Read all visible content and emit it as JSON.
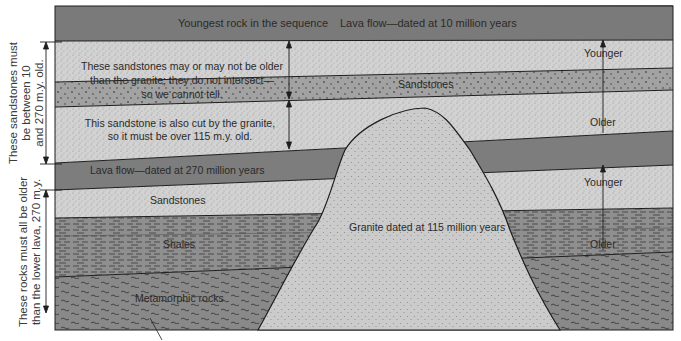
{
  "diagram": {
    "type": "geologic-cross-section",
    "colors": {
      "lava": "#7d7d7d",
      "sandstone_light": "#cfcfcf",
      "sandstone_coarse": "#9c9c9c",
      "shale": "#8e8e8e",
      "metamorphic": "#8a8a8a",
      "granite": "#c9c9c9",
      "line": "#1e1e1e"
    },
    "layers": [
      {
        "id": "upper-lava",
        "label": "Lava flow—dated at 10 million years",
        "note": "Youngest rock in the sequence"
      },
      {
        "id": "upper-sandstone-1",
        "label": "These sandstones may or may not be older than the granite; they do not intersect—so we cannot tell."
      },
      {
        "id": "upper-sandstone-coarse",
        "label": "Sandstones"
      },
      {
        "id": "upper-sandstone-2",
        "label": "This sandstone is also cut by the granite, so it must be over 115 m.y. old."
      },
      {
        "id": "lower-lava",
        "label": "Lava flow—dated at 270 million years"
      },
      {
        "id": "lower-sandstone",
        "label": "Sandstones"
      },
      {
        "id": "shales",
        "label": "Shales"
      },
      {
        "id": "metamorphic",
        "label": "Metamorphic rocks"
      },
      {
        "id": "granite",
        "label": "Granite dated at 115 million years"
      }
    ],
    "text": {
      "youngest": "Youngest rock in the sequence",
      "lava_top": "Lava flow—dated at 10 million years",
      "may_or_may_not_1": "These sandstones may or may not be older",
      "may_or_may_not_2": "than the granite; they do not intersect—",
      "may_or_may_not_3": "so we cannot tell.",
      "sandstones_upper": "Sandstones",
      "cut_by_granite_1": "This sandstone is also cut by the granite,",
      "cut_by_granite_2": "so it must be over 115 m.y. old.",
      "lava_mid": "Lava flow—dated at 270 million years",
      "sandstones_lower": "Sandstones",
      "shales": "Shales",
      "metamorphic": "Metamorphic rocks",
      "granite": "Granite dated at 115 million years",
      "younger_upper": "Younger",
      "older_upper": "Older",
      "younger_lower": "Younger",
      "older_lower": "Older"
    },
    "side_labels": {
      "upper": [
        "These sandstones must",
        "be between 10",
        "and 270 m.y. old."
      ],
      "lower": [
        "These rocks must all be older",
        "than the lower lava, 270 m.y."
      ]
    }
  }
}
